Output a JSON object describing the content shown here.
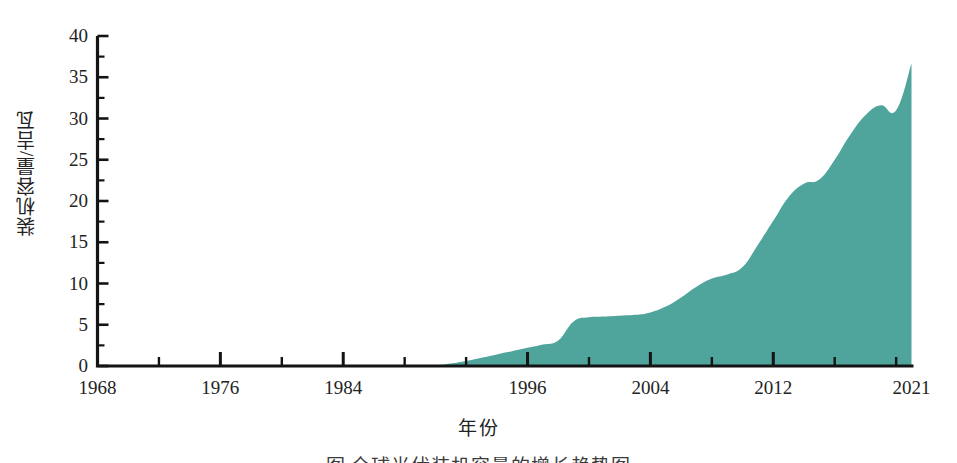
{
  "figure": {
    "caption": "图 全球光伏装机容量的增长趋势图",
    "background_color": "#ffffff"
  },
  "chart_data": {
    "type": "area",
    "title": "",
    "xlabel": "年份",
    "ylabel": "装机容量/吉瓦",
    "series_color": "#4fa49b",
    "axis_color": "#1a1a1a",
    "grid": false,
    "legend": null,
    "xlim": [
      1968,
      2021
    ],
    "ylim": [
      0,
      40
    ],
    "x_tick_labels": [
      "1968",
      "1976",
      "1984",
      "1996",
      "2004",
      "2012",
      "2021"
    ],
    "x_tick_values": [
      1968,
      1976,
      1984,
      1996,
      2004,
      2012,
      2021
    ],
    "x_minor_tick_step": 4,
    "y_tick_labels": [
      "0",
      "5",
      "10",
      "15",
      "20",
      "25",
      "30",
      "35",
      "40"
    ],
    "y_tick_values": [
      0,
      5,
      10,
      15,
      20,
      25,
      30,
      35,
      40
    ],
    "y_minor_tick_step": 2.5,
    "x": [
      1968,
      1972,
      1976,
      1980,
      1984,
      1986,
      1988,
      1990,
      1991,
      1992,
      1993,
      1994,
      1995,
      1996,
      1997,
      1998,
      1999,
      2000,
      2001,
      2002,
      2003,
      2004,
      2005,
      2006,
      2007,
      2008,
      2009,
      2010,
      2011,
      2012,
      2013,
      2014,
      2015,
      2016,
      2017,
      2018,
      2019,
      2020,
      2021
    ],
    "values": [
      0,
      0,
      0,
      0,
      0,
      0,
      0,
      0.1,
      0.3,
      0.6,
      1.0,
      1.4,
      1.8,
      2.2,
      2.6,
      3.1,
      5.4,
      5.9,
      6.0,
      6.1,
      6.2,
      6.5,
      7.2,
      8.3,
      9.6,
      10.6,
      11.1,
      12.0,
      14.7,
      17.6,
      20.5,
      22.1,
      22.6,
      25.0,
      28.0,
      30.4,
      31.6,
      31.0,
      36.7
    ],
    "unit": "GW"
  }
}
